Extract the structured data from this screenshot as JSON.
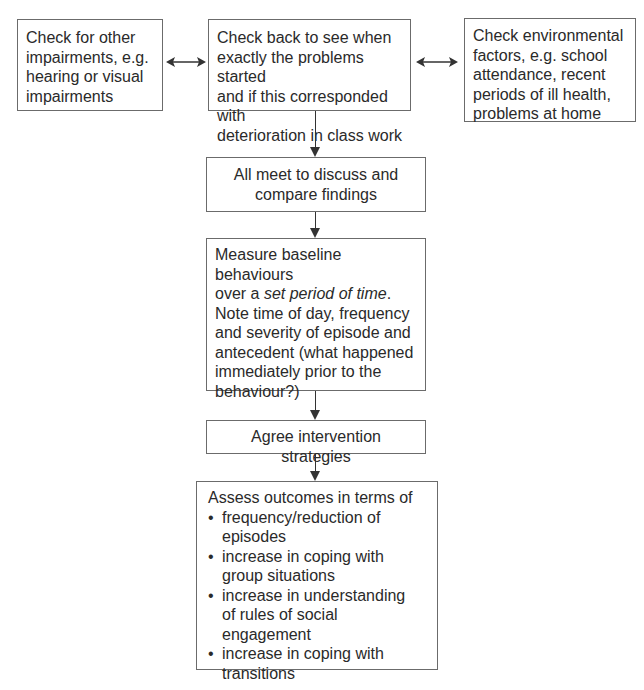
{
  "diagram": {
    "type": "flowchart",
    "top_row": {
      "left": {
        "lines": [
          "Check for other",
          "impairments, e.g.",
          "hearing or visual",
          "impairments"
        ]
      },
      "center": {
        "lines": [
          "Check back to see when",
          "exactly the problems started",
          "and if this corresponded with",
          "deterioration in class work"
        ]
      },
      "right": {
        "lines": [
          "Check environmental",
          "factors, e.g. school",
          "attendance, recent",
          "periods of ill health,",
          "problems at home"
        ]
      }
    },
    "step_meet": {
      "lines": [
        "All meet to discuss and",
        "compare findings"
      ]
    },
    "step_measure": {
      "line1": "Measure baseline behaviours",
      "line2_prefix": "over a ",
      "line2_italic": "set period of time",
      "line2_suffix": ".",
      "rest": [
        "Note time of day, frequency",
        "and severity of episode and",
        "antecedent (what happened",
        "immediately prior to the",
        "behaviour?)"
      ]
    },
    "step_agree": {
      "label": "Agree intervention strategies"
    },
    "step_assess": {
      "heading": "Assess outcomes in terms of",
      "bullets": [
        [
          "frequency/reduction of",
          "episodes"
        ],
        [
          "increase in coping with",
          "group situations"
        ],
        [
          "increase in understanding",
          "of rules of social engagement"
        ],
        [
          "increase in coping with",
          "transitions"
        ]
      ]
    },
    "connectors": {
      "left_center": "bidirectional-arrow",
      "center_right": "bidirectional-arrow",
      "vertical": "down-arrows"
    },
    "colors": {
      "border": "#6b6b6b",
      "arrow": "#333333",
      "text": "#2a2a2a"
    }
  }
}
